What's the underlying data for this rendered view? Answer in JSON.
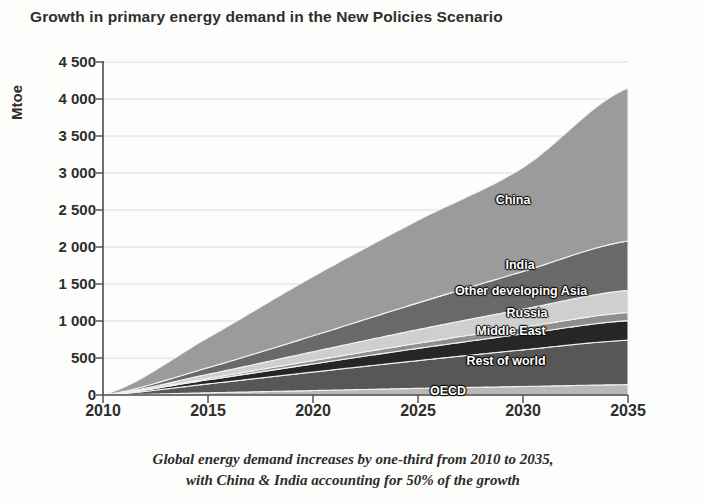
{
  "chart_data": {
    "type": "area",
    "stacked": true,
    "title": "Growth in primary energy demand in the New Policies Scenario",
    "caption_line1": "Global energy demand increases by one-third from 2010 to 2035,",
    "caption_line2": "with China & India accounting for 50% of the growth",
    "xlabel": "",
    "ylabel": "Mtoe",
    "x": [
      2010,
      2015,
      2020,
      2025,
      2030,
      2035
    ],
    "xlim": [
      2010,
      2035
    ],
    "ylim": [
      0,
      4500
    ],
    "xticks": [
      "2010",
      "2015",
      "2020",
      "2025",
      "2030",
      "2035"
    ],
    "yticks": [
      "0",
      "500",
      "1 000",
      "1 500",
      "2 000",
      "2 500",
      "3 000",
      "3 500",
      "4 000",
      "4 500"
    ],
    "ytick_values": [
      0,
      500,
      1000,
      1500,
      2000,
      2500,
      3000,
      3500,
      4000,
      4500
    ],
    "grid": true,
    "legend_position": "inline-labels",
    "series": [
      {
        "name": "OECD",
        "color": "#b8b8b8",
        "values": [
          0,
          30,
          60,
          90,
          115,
          140
        ]
      },
      {
        "name": "Rest of world",
        "color": "#575757",
        "values": [
          0,
          120,
          250,
          375,
          495,
          600
        ]
      },
      {
        "name": "Middle East",
        "color": "#262626",
        "values": [
          0,
          55,
          110,
          165,
          215,
          265
        ]
      },
      {
        "name": "Russia",
        "color": "#8f8f8f",
        "values": [
          0,
          20,
          45,
          70,
          90,
          110
        ]
      },
      {
        "name": "Other developing Asia",
        "color": "#cfcfcf",
        "values": [
          0,
          55,
          120,
          185,
          245,
          300
        ]
      },
      {
        "name": "India",
        "color": "#696969",
        "values": [
          0,
          90,
          215,
          360,
          510,
          665
        ]
      },
      {
        "name": "China",
        "color": "#9b9b9b",
        "values": [
          0,
          405,
          800,
          1115,
          1405,
          2065
        ]
      }
    ],
    "total_2035": 4145,
    "series_labels": [
      {
        "name": "China",
        "x": 513,
        "y": 200
      },
      {
        "name": "India",
        "x": 520,
        "y": 265
      },
      {
        "name": "Other developing Asia",
        "x": 521,
        "y": 291
      },
      {
        "name": "Russia",
        "x": 527,
        "y": 313
      },
      {
        "name": "Middle East",
        "x": 511,
        "y": 331
      },
      {
        "name": "Rest of world",
        "x": 506,
        "y": 361
      },
      {
        "name": "OECD",
        "x": 448,
        "y": 391
      }
    ]
  }
}
